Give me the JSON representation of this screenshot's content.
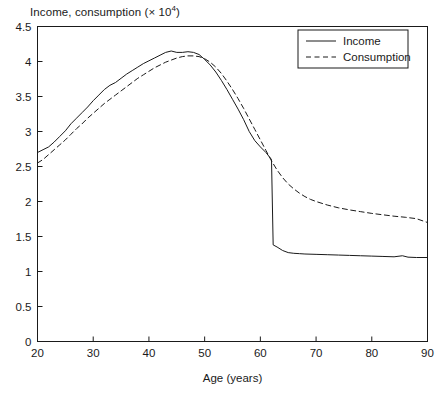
{
  "chart_data": {
    "type": "line",
    "title_main": "Income, consumption (× 10",
    "title_exp": "4",
    "title_tail": ")",
    "xlabel": "Age (years)",
    "ylabel": "",
    "xlim": [
      20,
      90
    ],
    "ylim": [
      0,
      4.5
    ],
    "xticks": [
      20,
      30,
      40,
      50,
      60,
      70,
      80,
      90
    ],
    "xtick_labels": [
      "20",
      "30",
      "40",
      "50",
      "60",
      "70",
      "80",
      "90"
    ],
    "yticks": [
      0,
      0.5,
      1,
      1.5,
      2,
      2.5,
      3,
      3.5,
      4,
      4.5
    ],
    "ytick_labels": [
      "0",
      "0.5",
      "1",
      "1.5",
      "2",
      "2.5",
      "3",
      "3.5",
      "4",
      "4.5"
    ],
    "grid": false,
    "legend_position": "top-right",
    "line_color": "#1a1a1a",
    "background": "#ffffff",
    "series": [
      {
        "name": "Income",
        "style": "solid",
        "x": [
          20,
          21,
          22,
          23,
          24,
          25,
          26,
          27,
          28,
          29,
          30,
          31,
          32,
          33,
          34,
          35,
          36,
          37,
          38,
          39,
          40,
          41,
          42,
          43,
          44,
          45,
          46,
          47,
          48,
          49,
          50,
          51,
          52,
          53,
          54,
          55,
          56,
          57,
          58,
          59,
          60,
          61,
          62,
          62.3,
          63,
          64,
          65,
          66,
          67,
          68,
          70,
          72,
          74,
          76,
          78,
          80,
          82,
          84,
          85.5,
          86.5,
          88,
          90
        ],
        "y": [
          2.7,
          2.74,
          2.78,
          2.85,
          2.93,
          3.01,
          3.11,
          3.19,
          3.27,
          3.35,
          3.44,
          3.52,
          3.6,
          3.66,
          3.7,
          3.76,
          3.82,
          3.87,
          3.92,
          3.97,
          4.01,
          4.05,
          4.09,
          4.13,
          4.15,
          4.13,
          4.13,
          4.14,
          4.13,
          4.1,
          4.03,
          3.95,
          3.85,
          3.73,
          3.6,
          3.46,
          3.32,
          3.17,
          3.0,
          2.87,
          2.78,
          2.7,
          2.6,
          1.38,
          1.35,
          1.3,
          1.27,
          1.26,
          1.255,
          1.25,
          1.245,
          1.24,
          1.235,
          1.23,
          1.225,
          1.22,
          1.215,
          1.21,
          1.225,
          1.205,
          1.2,
          1.2
        ]
      },
      {
        "name": "Consumption",
        "style": "dashed",
        "x": [
          20,
          21,
          22,
          23,
          24,
          25,
          26,
          27,
          28,
          29,
          30,
          31,
          32,
          33,
          34,
          35,
          36,
          37,
          38,
          39,
          40,
          41,
          42,
          43,
          44,
          45,
          46,
          47,
          48,
          49,
          50,
          51,
          52,
          53,
          54,
          55,
          56,
          57,
          58,
          59,
          60,
          61,
          62,
          63,
          64,
          65,
          66,
          67,
          68,
          69,
          70,
          72,
          74,
          76,
          78,
          80,
          82,
          84,
          86,
          88,
          90
        ],
        "y": [
          2.55,
          2.6,
          2.67,
          2.74,
          2.81,
          2.88,
          2.96,
          3.04,
          3.11,
          3.19,
          3.26,
          3.33,
          3.4,
          3.46,
          3.52,
          3.58,
          3.64,
          3.7,
          3.76,
          3.81,
          3.86,
          3.91,
          3.95,
          3.99,
          4.02,
          4.05,
          4.07,
          4.08,
          4.08,
          4.07,
          4.04,
          3.99,
          3.92,
          3.83,
          3.72,
          3.6,
          3.47,
          3.33,
          3.18,
          3.03,
          2.88,
          2.73,
          2.58,
          2.45,
          2.34,
          2.25,
          2.18,
          2.12,
          2.07,
          2.03,
          2.0,
          1.95,
          1.91,
          1.88,
          1.855,
          1.83,
          1.81,
          1.79,
          1.775,
          1.755,
          1.7
        ]
      }
    ]
  },
  "legend": {
    "items": [
      {
        "label": "Income",
        "style": "solid"
      },
      {
        "label": "Consumption",
        "style": "dashed"
      }
    ]
  }
}
